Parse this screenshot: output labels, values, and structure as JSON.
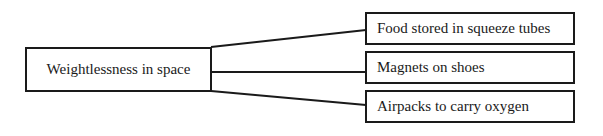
{
  "diagram": {
    "root": {
      "label": "Weightlessness in space"
    },
    "children": [
      {
        "label": "Food stored in squeeze tubes"
      },
      {
        "label": "Magnets on shoes"
      },
      {
        "label": "Airpacks to carry oxygen"
      }
    ]
  }
}
